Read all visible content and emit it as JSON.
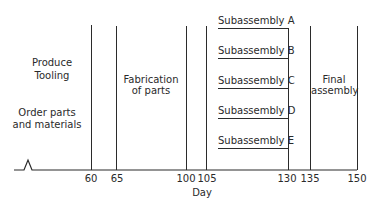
{
  "diagram": {
    "type": "project-schedule",
    "axis": {
      "label": "Day",
      "ticks": [
        "60",
        "65",
        "100",
        "105",
        "130",
        "135",
        "150"
      ]
    },
    "phases": {
      "order_parts": "Order parts\nand materials",
      "order_parts_line1": "Order parts",
      "order_parts_line2": "and materials",
      "produce_tooling_line1": "Produce",
      "produce_tooling_line2": "Tooling",
      "fabrication_line1": "Fabrication",
      "fabrication_line2": "of parts",
      "final_line1": "Final",
      "final_line2": "assembly"
    },
    "subassemblies": [
      {
        "label": "Subassembly  A"
      },
      {
        "label": "Subassembly  B"
      },
      {
        "label": "Subassembly  C"
      },
      {
        "label": "Subassembly  D"
      },
      {
        "label": "Subassembly  E"
      }
    ]
  }
}
